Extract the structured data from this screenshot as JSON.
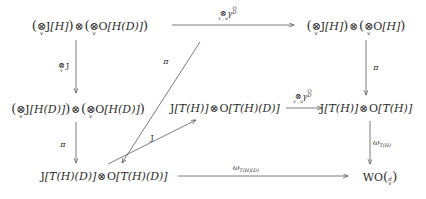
{
  "diagram": {
    "type": "commutative-diagram",
    "title": "",
    "canvas": {
      "width": 426,
      "height": 199
    },
    "stroke_color": "#5a5a5a",
    "text_color": "#2b2b2b",
    "background": "#ffffff",
    "nodes": [
      {
        "id": "top-left",
        "latex": "(\\bigotimes_v J[H]) \\otimes (\\bigotimes_v O[H(D)])",
        "plain": "(⊗_v J[H]) ⊗ (⊗_v O[H(D)])",
        "x": 90,
        "y": 25
      },
      {
        "id": "top-right",
        "latex": "(\\bigotimes_v J[H]) \\otimes (\\bigotimes_v O[H])",
        "plain": "(⊗_v J[H]) ⊗ (⊗_v O[H])",
        "x": 356,
        "y": 25
      },
      {
        "id": "mid-left",
        "latex": "(\\bigotimes_v J[H(D)]) \\otimes (\\bigotimes_v O[H(D)])",
        "plain": "(⊗_v J[H(D)]) ⊗ (⊗_v O[H(D)])",
        "x": 78,
        "y": 108
      },
      {
        "id": "mid-center",
        "latex": "J[T(H)] \\otimes O[T(H)(D)]",
        "plain": "J[T(H)] ⊗ O[T(H)(D)]",
        "x": 225,
        "y": 108
      },
      {
        "id": "mid-right",
        "latex": "J[T(H)] \\otimes O[T(H)]",
        "plain": "J[T(H)] ⊗ O[T(H)]",
        "x": 366,
        "y": 108
      },
      {
        "id": "bottom-left",
        "latex": "J[T(H)(D)] \\otimes O[T(H)(D)]",
        "plain": "J[T(H)(D)] ⊗ O[T(H)(D)]",
        "x": 104,
        "y": 176
      },
      {
        "id": "bottom-right",
        "latex": "WO\\binom{d}{v}",
        "plain": "WO(d over v)",
        "x": 380,
        "y": 176
      }
    ],
    "arrows": [
      {
        "id": "top-horizontal",
        "from": "top-left",
        "to": "top-right",
        "label_plain": "⊗_{v,u} γ_D^O",
        "label_x": 228,
        "label_y": 13,
        "direction": "right"
      },
      {
        "id": "left-upper-vertical",
        "from": "top-left",
        "to": "mid-left",
        "label_plain": "⊗_v J",
        "label_x": 63,
        "label_y": 66,
        "direction": "down"
      },
      {
        "id": "left-lower-vertical",
        "from": "mid-left",
        "to": "bottom-left",
        "label_plain": "π",
        "label_x": 63,
        "label_y": 145,
        "direction": "down"
      },
      {
        "id": "upper-diagonal-pi",
        "from": "top-left",
        "to": "bottom-left",
        "label_plain": "π",
        "label_x": 166,
        "label_y": 62,
        "direction": "down-left"
      },
      {
        "id": "lower-diagonal-J",
        "from": "bottom-left",
        "to": "mid-center",
        "label_plain": "J",
        "label_x": 152,
        "label_y": 138,
        "direction": "up-right"
      },
      {
        "id": "mid-horizontal",
        "from": "mid-center",
        "to": "mid-right",
        "label_plain": "⊗_{v,u} γ_D^O",
        "label_x": 303,
        "label_y": 96,
        "direction": "right"
      },
      {
        "id": "right-upper-vertical",
        "from": "top-right",
        "to": "mid-right",
        "label_plain": "π",
        "label_x": 376,
        "label_y": 68,
        "direction": "down"
      },
      {
        "id": "right-lower-vertical",
        "from": "mid-right",
        "to": "bottom-right",
        "label_plain": "ω_{T(H)}",
        "label_x": 382,
        "label_y": 143,
        "direction": "down"
      },
      {
        "id": "bottom-horizontal",
        "from": "bottom-left",
        "to": "bottom-right",
        "label_plain": "ω_{T(H)(D)}",
        "label_x": 246,
        "label_y": 168,
        "direction": "right"
      }
    ],
    "symbols": {
      "tensor": "⊗",
      "gamma": "γ",
      "omega": "ω",
      "pi": "π",
      "J": "J",
      "O": "O",
      "H": "H",
      "D": "D",
      "T": "T",
      "W": "W",
      "v": "v",
      "u": "u",
      "d": "d"
    }
  }
}
